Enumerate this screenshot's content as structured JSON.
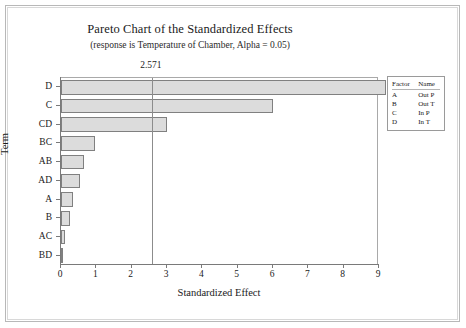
{
  "chart_data": {
    "type": "bar",
    "orientation": "horizontal",
    "title": "Pareto Chart of the Standardized Effects",
    "subtitle": "(response is Temperature of Chamber, Alpha = 0.05)",
    "xlabel": "Standardized Effect",
    "ylabel": "Term",
    "categories": [
      "D",
      "C",
      "CD",
      "BC",
      "AB",
      "AD",
      "A",
      "B",
      "AC",
      "BD"
    ],
    "values": [
      9.2,
      6.0,
      3.0,
      0.95,
      0.65,
      0.55,
      0.35,
      0.25,
      0.12,
      0.07
    ],
    "xlim": [
      0,
      9
    ],
    "xticks": [
      0,
      1,
      2,
      3,
      4,
      5,
      6,
      7,
      8,
      9
    ],
    "xtick_labels": [
      "0",
      "1",
      "2",
      "3",
      "4",
      "5",
      "6",
      "7",
      "8",
      "9"
    ],
    "grid": false,
    "legend_position": "right",
    "reference_line": {
      "value": 2.571,
      "label": "2.571"
    },
    "bar_fill_color": "#dcdcdc",
    "bar_border_color": "#808080",
    "axis_color": "#7a7a7a"
  },
  "legend": {
    "headers": [
      "Factor",
      "Name"
    ],
    "rows": [
      {
        "factor": "A",
        "name": "Out P"
      },
      {
        "factor": "B",
        "name": "Out T"
      },
      {
        "factor": "C",
        "name": "In P"
      },
      {
        "factor": "D",
        "name": "In T"
      }
    ]
  }
}
